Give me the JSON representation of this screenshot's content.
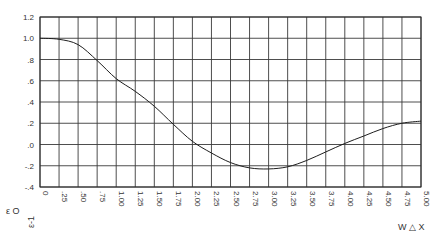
{
  "chart_data": {
    "type": "line",
    "title": "",
    "xlabel": "W △ X",
    "ylabel": "",
    "xlim": [
      0,
      5.0
    ],
    "ylim": [
      -0.4,
      1.2
    ],
    "grid": true,
    "x_ticks": [
      "0",
      ".25",
      ".50",
      ".75",
      "1.00",
      "1.25",
      "1.50",
      "1.75",
      "2.00",
      "2.25",
      "2.50",
      "2.75",
      "3.00",
      "3.25",
      "3.50",
      "3.75",
      "4.00",
      "4.25",
      "4.50",
      "4.75",
      "5.00"
    ],
    "y_ticks": [
      "1.2",
      "1.0",
      ".8",
      ".6",
      ".4",
      ".2",
      ".0",
      "-.2",
      "-.4"
    ],
    "y_tick_values": [
      1.2,
      1.0,
      0.8,
      0.6,
      0.4,
      0.2,
      0.0,
      -0.2,
      -0.4
    ],
    "corner_labels": {
      "left": "ε  O",
      "rotated": "ε-1"
    },
    "series": [
      {
        "name": "curve",
        "x": [
          0,
          0.25,
          0.5,
          0.75,
          1.0,
          1.25,
          1.5,
          1.75,
          2.0,
          2.25,
          2.5,
          2.75,
          3.0,
          3.25,
          3.5,
          3.75,
          4.0,
          4.25,
          4.5,
          4.75,
          5.0
        ],
        "y": [
          1.0,
          0.99,
          0.94,
          0.79,
          0.62,
          0.5,
          0.36,
          0.19,
          0.03,
          -0.08,
          -0.17,
          -0.22,
          -0.23,
          -0.21,
          -0.15,
          -0.07,
          0.01,
          0.08,
          0.15,
          0.2,
          0.22
        ]
      }
    ]
  }
}
